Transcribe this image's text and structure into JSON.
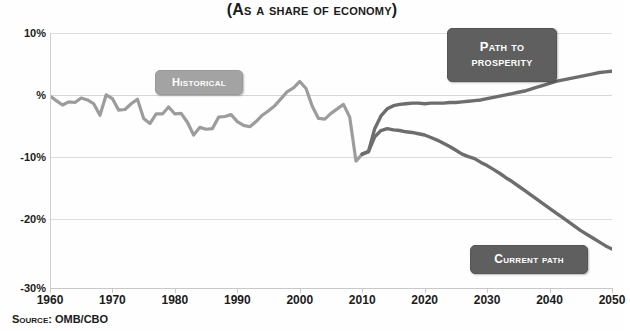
{
  "chart_data": {
    "type": "line",
    "title": "(As a Share of Economy)",
    "xlabel": "",
    "ylabel": "",
    "source": "Source: OMB/CBO",
    "grid": true,
    "legend_position": "inline-callouts",
    "xlim": [
      1960,
      2050
    ],
    "ylim": [
      -30,
      10
    ],
    "xticks": [
      "1960",
      "1970",
      "1980",
      "1990",
      "2000",
      "2010",
      "2020",
      "2030",
      "2040",
      "2050"
    ],
    "yticks": [
      "10%",
      "%",
      "-10%",
      "-20%",
      "-30%"
    ],
    "ytick_values": [
      10,
      0,
      -10,
      -20,
      -30
    ],
    "colors": {
      "historical": "#9c9c9c",
      "projection": "#6d6d6d",
      "badge_light": "#a3a3a3",
      "badge_dark": "#5f5f5f",
      "grid": "#dddddd",
      "text": "#1b1b1b"
    },
    "series": [
      {
        "name": "Historical",
        "color": "#9c9c9c",
        "x": [
          1960,
          1961,
          1962,
          1963,
          1964,
          1965,
          1966,
          1967,
          1968,
          1969,
          1970,
          1971,
          1972,
          1973,
          1974,
          1975,
          1976,
          1977,
          1978,
          1979,
          1980,
          1981,
          1982,
          1983,
          1984,
          1985,
          1986,
          1987,
          1988,
          1989,
          1990,
          1991,
          1992,
          1993,
          1994,
          1995,
          1996,
          1997,
          1998,
          1999,
          2000,
          2001,
          2002,
          2003,
          2004,
          2005,
          2006,
          2007,
          2008,
          2009,
          2010
        ],
        "values": [
          0.1,
          -0.6,
          -1.3,
          -0.8,
          -0.9,
          -0.2,
          -0.5,
          -1.1,
          -2.9,
          0.3,
          -0.3,
          -2.1,
          -2.0,
          -1.1,
          -0.4,
          -3.4,
          -4.2,
          -2.7,
          -2.7,
          -1.6,
          -2.7,
          -2.6,
          -4.0,
          -6.0,
          -4.8,
          -5.1,
          -5.0,
          -3.2,
          -3.1,
          -2.8,
          -3.9,
          -4.5,
          -4.7,
          -3.9,
          -2.9,
          -2.2,
          -1.4,
          -0.3,
          0.8,
          1.4,
          2.4,
          1.3,
          -1.5,
          -3.4,
          -3.5,
          -2.6,
          -1.9,
          -1.2,
          -3.2,
          -10.1,
          -9.0
        ],
        "ylabel_units": "percent of GDP"
      },
      {
        "name": "Path to Prosperity",
        "color": "#6d6d6d",
        "x": [
          2010,
          2011,
          2012,
          2013,
          2014,
          2015,
          2016,
          2017,
          2018,
          2019,
          2020,
          2021,
          2022,
          2023,
          2024,
          2025,
          2026,
          2027,
          2028,
          2029,
          2030,
          2031,
          2032,
          2033,
          2034,
          2035,
          2036,
          2037,
          2038,
          2039,
          2040,
          2041,
          2042,
          2043,
          2044,
          2045,
          2046,
          2047,
          2048,
          2049,
          2050
        ],
        "values": [
          -9.0,
          -8.6,
          -5.0,
          -3.0,
          -1.9,
          -1.4,
          -1.2,
          -1.1,
          -1.0,
          -1.0,
          -1.1,
          -1.0,
          -1.0,
          -1.0,
          -0.9,
          -0.9,
          -0.8,
          -0.7,
          -0.6,
          -0.5,
          -0.3,
          -0.1,
          0.1,
          0.3,
          0.5,
          0.7,
          0.9,
          1.2,
          1.5,
          1.8,
          2.1,
          2.4,
          2.6,
          2.8,
          3.0,
          3.2,
          3.4,
          3.6,
          3.8,
          3.9,
          4.0
        ]
      },
      {
        "name": "Current Path",
        "color": "#6d6d6d",
        "x": [
          2010,
          2011,
          2012,
          2013,
          2014,
          2015,
          2016,
          2017,
          2018,
          2019,
          2020,
          2021,
          2022,
          2023,
          2024,
          2025,
          2026,
          2027,
          2028,
          2029,
          2030,
          2031,
          2032,
          2033,
          2034,
          2035,
          2036,
          2037,
          2038,
          2039,
          2040,
          2041,
          2042,
          2043,
          2044,
          2045,
          2046,
          2047,
          2048,
          2049,
          2050
        ],
        "values": [
          -9.0,
          -8.6,
          -6.3,
          -5.3,
          -5.0,
          -5.2,
          -5.3,
          -5.5,
          -5.6,
          -5.8,
          -6.0,
          -6.4,
          -6.8,
          -7.3,
          -7.8,
          -8.4,
          -9.0,
          -9.4,
          -9.7,
          -10.3,
          -10.8,
          -11.4,
          -12.0,
          -12.7,
          -13.3,
          -14.0,
          -14.7,
          -15.4,
          -16.1,
          -16.8,
          -17.5,
          -18.2,
          -18.9,
          -19.6,
          -20.3,
          -21.0,
          -21.6,
          -22.2,
          -22.8,
          -23.4,
          -23.9
        ]
      }
    ],
    "annotations": [
      {
        "id": "historical",
        "label": "Historical",
        "style": "light-badge"
      },
      {
        "id": "prosperity",
        "label": "Path to Prosperity",
        "label_line1": "Path to",
        "label_line2": "Prosperity",
        "style": "dark-badge"
      },
      {
        "id": "current",
        "label": "Current Path",
        "style": "dark-badge"
      }
    ]
  }
}
